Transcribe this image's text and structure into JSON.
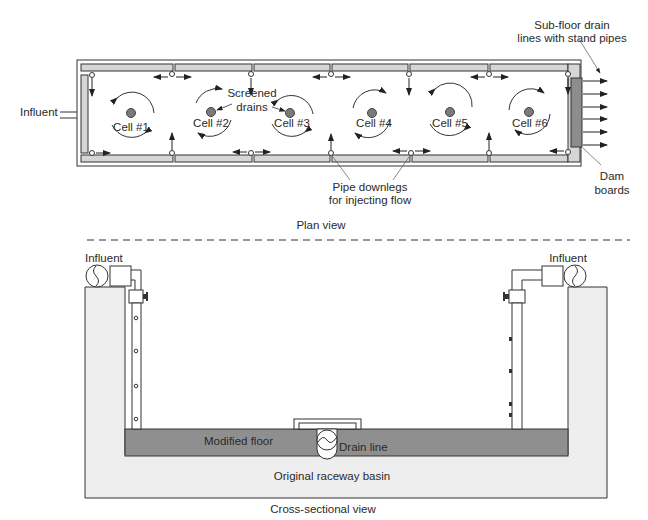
{
  "plan_view": {
    "title": "Plan view",
    "labels": {
      "influent": "Influent",
      "screened_drains": [
        "Screened",
        "drains"
      ],
      "subfloor": [
        "Sub-floor drain",
        "lines with stand pipes"
      ],
      "dam_boards": [
        "Dam",
        "boards"
      ],
      "pipe_downlegs": [
        "Pipe downlegs",
        "for injecting flow"
      ]
    },
    "cells": [
      {
        "label": "Cell #1"
      },
      {
        "label": "Cell #2"
      },
      {
        "label": "Cell #3"
      },
      {
        "label": "Cell #4"
      },
      {
        "label": "Cell #5"
      },
      {
        "label": "Cell #6"
      }
    ]
  },
  "cross_section": {
    "title": "Cross-sectional view",
    "labels": {
      "influent_left": "Influent",
      "influent_right": "Influent",
      "modified_floor": "Modified floor",
      "drain_line": "Drain line",
      "original_basin": "Original raceway basin"
    }
  },
  "colors": {
    "wall": "#d6d6d6",
    "dam": "#8c8c8c",
    "floor": "#8f8f8f",
    "basin": "#eeeeee",
    "drain_dot": "#7a7a7a",
    "line": "#333333"
  }
}
